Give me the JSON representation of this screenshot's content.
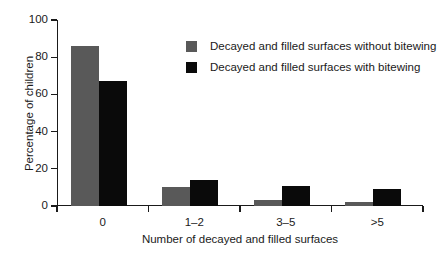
{
  "chart_data": {
    "type": "bar",
    "title": "",
    "xlabel": "Number of decayed and filled surfaces",
    "ylabel": "Percentage of children",
    "categories": [
      "0",
      "1–2",
      "3–5",
      ">5"
    ],
    "series": [
      {
        "name": "Decayed and filled surfaces without bitewing",
        "color": "#595959",
        "values": [
          86,
          10,
          3,
          2
        ]
      },
      {
        "name": "Decayed and filled surfaces with bitewing",
        "color": "#0a0a0a",
        "values": [
          67,
          14,
          11,
          9
        ]
      }
    ],
    "ylim": [
      0,
      100
    ],
    "yticks": [
      0,
      20,
      40,
      60,
      80,
      100
    ],
    "ytick_labels": [
      "0",
      "20",
      "40",
      "60",
      "80",
      "100"
    ],
    "grid": false,
    "legend_position": "upper-center-right"
  },
  "legend": {
    "items": [
      {
        "label": "Decayed and filled surfaces without bitewing",
        "color": "#595959"
      },
      {
        "label": "Decayed and filled surfaces with bitewing",
        "color": "#0a0a0a"
      }
    ]
  },
  "axes": {
    "x_title": "Number of decayed and filled surfaces",
    "y_title": "Percentage of children"
  }
}
